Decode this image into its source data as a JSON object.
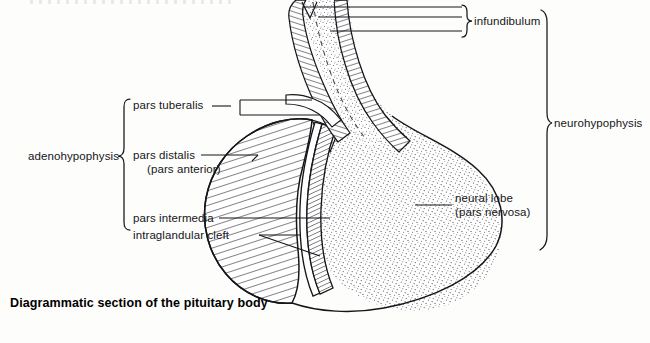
{
  "figure": {
    "caption": "Diagrammatic section of the pituitary body",
    "labels": {
      "adenohypophysis": "adenohypophysis",
      "pars_tuberalis": "pars tuberalis",
      "pars_distalis": "pars distalis",
      "pars_anterior": "(pars anterior)",
      "pars_intermedia": "pars intermedia",
      "intraglandular_cleft": "intraglandular cleft",
      "infundibulum": "infundibulum",
      "neurohypophysis": "neurohypophysis",
      "neural_lobe": "neural lobe",
      "pars_nervosa": "(pars nervosa)"
    },
    "colors": {
      "ink": "#101114",
      "paper": "#fdfdfb",
      "stipple": "#5d5d63",
      "hatch": "#15161a"
    }
  }
}
